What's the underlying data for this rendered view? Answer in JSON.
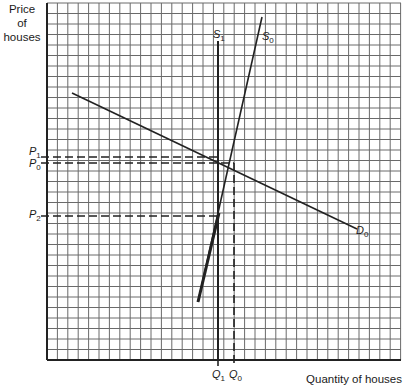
{
  "axes": {
    "y_label_lines": [
      "Price",
      "of",
      "houses"
    ],
    "x_label": "Quantity of houses"
  },
  "curves": {
    "S1": {
      "label": "S",
      "sub": "1"
    },
    "S0": {
      "label": "S",
      "sub": "0"
    },
    "D0": {
      "label": "D",
      "sub": "0"
    }
  },
  "price_marks": [
    {
      "label": "P",
      "sub": "1"
    },
    {
      "label": "P",
      "sub": "0"
    },
    {
      "label": "P",
      "sub": "2"
    }
  ],
  "quantity_marks": [
    {
      "label": "Q",
      "sub": "1"
    },
    {
      "label": "Q",
      "sub": "0"
    }
  ],
  "colors": {
    "grid": "#555555",
    "line": "#222222",
    "background": "#ffffff"
  }
}
